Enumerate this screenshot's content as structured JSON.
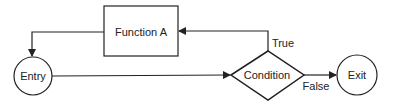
{
  "diagram": {
    "type": "flowchart",
    "nodes": {
      "function_a": {
        "label": "Function A",
        "shape": "rectangle"
      },
      "entry": {
        "label": "Entry",
        "shape": "circle"
      },
      "condition": {
        "label": "Condition",
        "shape": "diamond"
      },
      "exit": {
        "label": "Exit",
        "shape": "circle"
      }
    },
    "edges": {
      "true_label": "True",
      "false_label": "False"
    },
    "colors": {
      "stroke": "#222222",
      "background": "#ffffff"
    }
  }
}
